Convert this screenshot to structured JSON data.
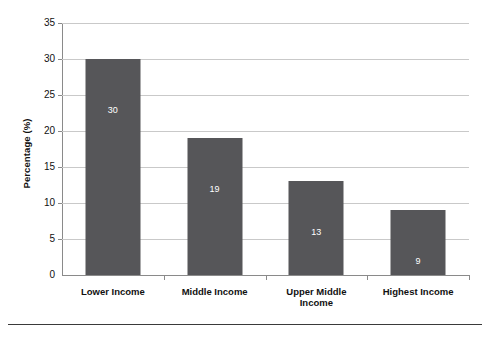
{
  "chart_data": {
    "type": "bar",
    "title": "",
    "subtitle": "",
    "xlabel": "",
    "ylabel": "Percentage (%)",
    "categories": [
      "Lower Income",
      "Middle Income",
      "Upper Middle Income",
      "Highest Income"
    ],
    "category_lines": [
      [
        "Lower Income"
      ],
      [
        "Middle Income"
      ],
      [
        "Upper Middle",
        "Income"
      ],
      [
        "Highest Income"
      ]
    ],
    "values": [
      30,
      19,
      13,
      9
    ],
    "data_labels": [
      "30",
      "19",
      "13",
      "9"
    ],
    "ylim": [
      0,
      35
    ],
    "ytick_step": 5,
    "ytick_labels": [
      "0",
      "5",
      "10",
      "15",
      "20",
      "25",
      "30",
      "35"
    ],
    "ytick_values": [
      0,
      5,
      10,
      15,
      20,
      25,
      30,
      35
    ],
    "grid": true,
    "grid_axis": "y",
    "legend": false,
    "legend_position": "none",
    "bar_color": "#565659",
    "grid_color": "#c9c9c9",
    "axis_color": "#8a8a8a",
    "data_label_color": "#ffffff",
    "background_color": "#ffffff"
  },
  "figure": {
    "footer_rule_color": "#3a3a3a"
  }
}
